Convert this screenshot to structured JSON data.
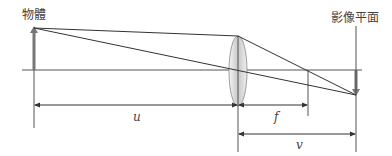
{
  "diagram": {
    "type": "thin-lens-ray-diagram",
    "labels": {
      "object": "物體",
      "image_plane": "影像平面",
      "object_distance": "u",
      "focal_length": "f",
      "image_distance": "v"
    },
    "colors": {
      "line": "#333333",
      "axis": "#555555",
      "arrow_fill": "#777777",
      "lens_fill": "#d9d9d9",
      "lens_stroke": "#888888"
    }
  }
}
